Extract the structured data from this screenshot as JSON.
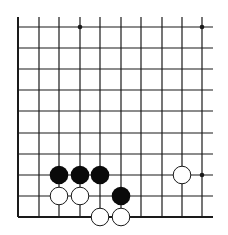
{
  "diagram": {
    "type": "go-board-fragment",
    "visible_columns": 10,
    "visible_rows": 10,
    "edges": {
      "left": true,
      "bottom": true,
      "top": false,
      "right": false
    },
    "grid": {
      "x": [
        18,
        39,
        59,
        80,
        100,
        121,
        141,
        162,
        182,
        202
      ],
      "y": [
        27,
        48,
        69,
        90,
        111,
        133,
        154,
        175,
        196,
        217
      ],
      "top_extend": 17,
      "right_extend": 213
    },
    "colors": {
      "line": "#1a1a1a",
      "black_stone": "#0a0a0a",
      "white_stone_fill": "#ffffff",
      "white_stone_stroke": "#1a1a1a",
      "background": "#ffffff"
    },
    "star_points": [
      {
        "col": 3,
        "row": 0
      },
      {
        "col": 9,
        "row": 0
      },
      {
        "col": 9,
        "row": 7
      }
    ],
    "stones": [
      {
        "color": "black",
        "col": 2,
        "row": 7
      },
      {
        "color": "black",
        "col": 3,
        "row": 7
      },
      {
        "color": "black",
        "col": 4,
        "row": 7
      },
      {
        "color": "black",
        "col": 5,
        "row": 8
      },
      {
        "color": "white",
        "col": 2,
        "row": 8
      },
      {
        "color": "white",
        "col": 3,
        "row": 8
      },
      {
        "color": "white",
        "col": 4,
        "row": 9
      },
      {
        "color": "white",
        "col": 5,
        "row": 9
      },
      {
        "color": "white",
        "col": 8,
        "row": 7
      }
    ]
  }
}
